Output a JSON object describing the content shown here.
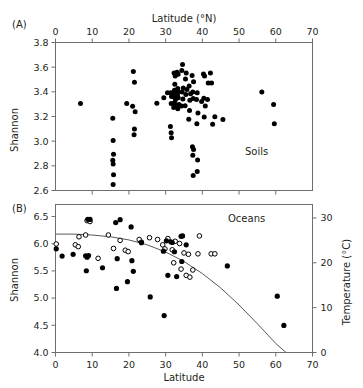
{
  "figure": {
    "panel_a_label": "(A)",
    "panel_b_label": "(B)",
    "panel_a_annotation": "Soils",
    "panel_b_annotation": "Oceans"
  },
  "chart_data": [
    {
      "type": "scatter",
      "panel": "(A)",
      "title": "Soils",
      "xlabel": "Latitude (°N)",
      "ylabel": "Shannon",
      "xlabel_position": "top",
      "xlim": [
        0,
        70
      ],
      "ylim": [
        2.6,
        3.8
      ],
      "xticks": [
        0,
        10,
        20,
        30,
        40,
        50,
        60,
        70
      ],
      "xticklabels": [
        "0",
        "10",
        "20",
        "30",
        "40",
        "50",
        "60",
        "70"
      ],
      "yticks": [
        2.6,
        2.8,
        3.0,
        3.2,
        3.4,
        3.6,
        3.8
      ],
      "yticklabels": [
        "2.6",
        "2.8",
        "3.0",
        "3.2",
        "3.4",
        "3.6",
        "3.8"
      ],
      "grid": false,
      "legend": "none",
      "marker": "filled-circle",
      "series": [
        {
          "name": "Soils",
          "marker": "filled-circle",
          "points": [
            [
              6.8,
              3.305
            ],
            [
              15.6,
              3.185
            ],
            [
              15.7,
              3.005
            ],
            [
              15.8,
              2.893
            ],
            [
              15.6,
              2.845
            ],
            [
              15.7,
              2.815
            ],
            [
              15.8,
              2.728
            ],
            [
              15.7,
              2.648
            ],
            [
              19.4,
              3.305
            ],
            [
              21.2,
              3.565
            ],
            [
              21.5,
              3.478
            ],
            [
              21.0,
              3.283
            ],
            [
              21.7,
              3.238
            ],
            [
              21.5,
              3.098
            ],
            [
              21.4,
              3.052
            ],
            [
              27.6,
              3.308
            ],
            [
              29.5,
              3.352
            ],
            [
              30.5,
              3.392
            ],
            [
              31.4,
              3.392
            ],
            [
              31.6,
              3.362
            ],
            [
              31.5,
              3.305
            ],
            [
              31.3,
              3.118
            ],
            [
              31.5,
              3.068
            ],
            [
              31.6,
              3.028
            ],
            [
              32.3,
              3.552
            ],
            [
              32.6,
              3.528
            ],
            [
              32.5,
              3.462
            ],
            [
              32.4,
              3.412
            ],
            [
              32.6,
              3.388
            ],
            [
              32.3,
              3.372
            ],
            [
              32.5,
              3.352
            ],
            [
              32.7,
              3.338
            ],
            [
              32.4,
              3.312
            ],
            [
              32.6,
              3.292
            ],
            [
              32.2,
              3.272
            ],
            [
              33.1,
              3.558
            ],
            [
              33.4,
              3.542
            ],
            [
              33.3,
              3.428
            ],
            [
              33.5,
              3.398
            ],
            [
              33.2,
              3.372
            ],
            [
              33.4,
              3.352
            ],
            [
              33.6,
              3.298
            ],
            [
              33.3,
              3.262
            ],
            [
              34.6,
              3.622
            ],
            [
              34.4,
              3.572
            ],
            [
              34.8,
              3.432
            ],
            [
              34.5,
              3.398
            ],
            [
              34.7,
              3.342
            ],
            [
              34.3,
              3.285
            ],
            [
              35.6,
              3.552
            ],
            [
              35.4,
              3.505
            ],
            [
              35.8,
              3.418
            ],
            [
              35.5,
              3.378
            ],
            [
              35.3,
              3.288
            ],
            [
              36.4,
              3.448
            ],
            [
              36.8,
              3.385
            ],
            [
              36.6,
              3.332
            ],
            [
              36.5,
              3.248
            ],
            [
              36.3,
              3.178
            ],
            [
              37.2,
              3.532
            ],
            [
              37.6,
              3.482
            ],
            [
              37.4,
              3.398
            ],
            [
              37.5,
              3.345
            ],
            [
              37.3,
              2.955
            ],
            [
              37.6,
              2.932
            ],
            [
              37.4,
              2.885
            ],
            [
              37.5,
              2.722
            ],
            [
              38.6,
              3.392
            ],
            [
              38.4,
              3.338
            ],
            [
              38.8,
              3.228
            ],
            [
              38.5,
              3.142
            ],
            [
              38.7,
              2.848
            ],
            [
              38.6,
              2.755
            ],
            [
              39.8,
              3.322
            ],
            [
              40.3,
              3.545
            ],
            [
              40.6,
              3.528
            ],
            [
              40.4,
              3.348
            ],
            [
              40.8,
              3.285
            ],
            [
              40.5,
              3.195
            ],
            [
              41.6,
              3.472
            ],
            [
              41.4,
              3.338
            ],
            [
              42.2,
              3.552
            ],
            [
              42.5,
              3.472
            ],
            [
              42.8,
              3.138
            ],
            [
              43.4,
              3.198
            ],
            [
              45.6,
              3.175
            ],
            [
              56.2,
              3.398
            ],
            [
              59.4,
              3.298
            ],
            [
              59.6,
              3.142
            ]
          ]
        }
      ]
    },
    {
      "type": "scatter",
      "panel": "(B)",
      "title": "Oceans",
      "xlabel": "Latitude",
      "ylabel": "Shannon",
      "y2label": "Temperature (°C)",
      "xlim": [
        0,
        70
      ],
      "ylim": [
        4.0,
        6.72
      ],
      "y2lim": [
        0,
        33
      ],
      "xticks": [
        0,
        10,
        20,
        30,
        40,
        50,
        60,
        70
      ],
      "xticklabels": [
        "0",
        "10",
        "20",
        "30",
        "40",
        "50",
        "60",
        "70"
      ],
      "yticks": [
        4.0,
        4.5,
        5.0,
        5.5,
        6.0,
        6.5
      ],
      "yticklabels": [
        "4.0",
        "4.5",
        "5.0",
        "5.5",
        "6.0",
        "6.5"
      ],
      "y2ticks": [
        0,
        10,
        20,
        30
      ],
      "y2ticklabels": [
        "0",
        "10",
        "20",
        "30"
      ],
      "grid": false,
      "legend": "none",
      "series": [
        {
          "name": "Shannon diversity",
          "marker": "filled-circle",
          "axis": "left",
          "points": [
            [
              0.2,
              5.905
            ],
            [
              1.8,
              5.772
            ],
            [
              4.8,
              5.805
            ],
            [
              8.2,
              5.778
            ],
            [
              8.6,
              5.752
            ],
            [
              9.0,
              5.782
            ],
            [
              8.8,
              6.448
            ],
            [
              9.4,
              6.445
            ],
            [
              8.4,
              5.502
            ],
            [
              12.8,
              5.558
            ],
            [
              16.4,
              6.388
            ],
            [
              16.8,
              5.725
            ],
            [
              16.6,
              5.178
            ],
            [
              17.6,
              6.442
            ],
            [
              19.6,
              5.302
            ],
            [
              20.6,
              6.308
            ],
            [
              20.8,
              5.688
            ],
            [
              21.2,
              5.492
            ],
            [
              23.4,
              6.018
            ],
            [
              25.8,
              5.022
            ],
            [
              29.4,
              5.862
            ],
            [
              29.6,
              4.678
            ],
            [
              30.2,
              6.052
            ],
            [
              30.6,
              5.418
            ],
            [
              31.4,
              6.035
            ],
            [
              31.8,
              6.022
            ],
            [
              32.4,
              5.852
            ],
            [
              33.0,
              5.395
            ],
            [
              34.2,
              6.135
            ],
            [
              34.6,
              6.142
            ],
            [
              34.4,
              5.672
            ],
            [
              35.6,
              5.978
            ],
            [
              46.8,
              5.592
            ],
            [
              60.4,
              5.035
            ],
            [
              62.2,
              4.498
            ]
          ]
        },
        {
          "name": "Temperature",
          "marker": "open-circle",
          "axis": "right",
          "points": [
            [
              0.2,
              24.2
            ],
            [
              5.4,
              24.0
            ],
            [
              6.2,
              23.6
            ],
            [
              6.4,
              25.8
            ],
            [
              8.2,
              26.2
            ],
            [
              8.6,
              29.4
            ],
            [
              9.4,
              29.2
            ],
            [
              11.6,
              21.0
            ],
            [
              14.4,
              26.2
            ],
            [
              15.8,
              23.2
            ],
            [
              17.6,
              25.0
            ],
            [
              19.0,
              22.8
            ],
            [
              19.8,
              22.5
            ],
            [
              22.8,
              25.2
            ],
            [
              23.4,
              24.6
            ],
            [
              25.6,
              25.6
            ],
            [
              27.8,
              25.2
            ],
            [
              29.2,
              24.0
            ],
            [
              29.8,
              23.1
            ],
            [
              30.6,
              25.4
            ],
            [
              31.8,
              22.9
            ],
            [
              32.6,
              24.8
            ],
            [
              32.2,
              20.0
            ],
            [
              33.8,
              24.3
            ],
            [
              34.2,
              18.6
            ],
            [
              35.0,
              22.2
            ],
            [
              35.6,
              17.2
            ],
            [
              36.2,
              21.9
            ],
            [
              36.6,
              16.8
            ],
            [
              37.4,
              18.4
            ],
            [
              38.8,
              22.0
            ],
            [
              39.2,
              26.0
            ],
            [
              42.4,
              22.0
            ],
            [
              43.4,
              22.0
            ]
          ]
        }
      ],
      "fit_curve": {
        "name": "temperature-latitude fit",
        "points": [
          [
            0,
            26.4
          ],
          [
            5,
            26.4
          ],
          [
            10,
            26.2
          ],
          [
            15,
            25.8
          ],
          [
            20,
            25.1
          ],
          [
            25,
            24.0
          ],
          [
            30,
            22.4
          ],
          [
            35,
            20.3
          ],
          [
            40,
            17.6
          ],
          [
            45,
            14.4
          ],
          [
            50,
            10.6
          ],
          [
            55,
            6.4
          ],
          [
            60,
            2.0
          ],
          [
            62.8,
            0.0
          ]
        ]
      }
    }
  ]
}
